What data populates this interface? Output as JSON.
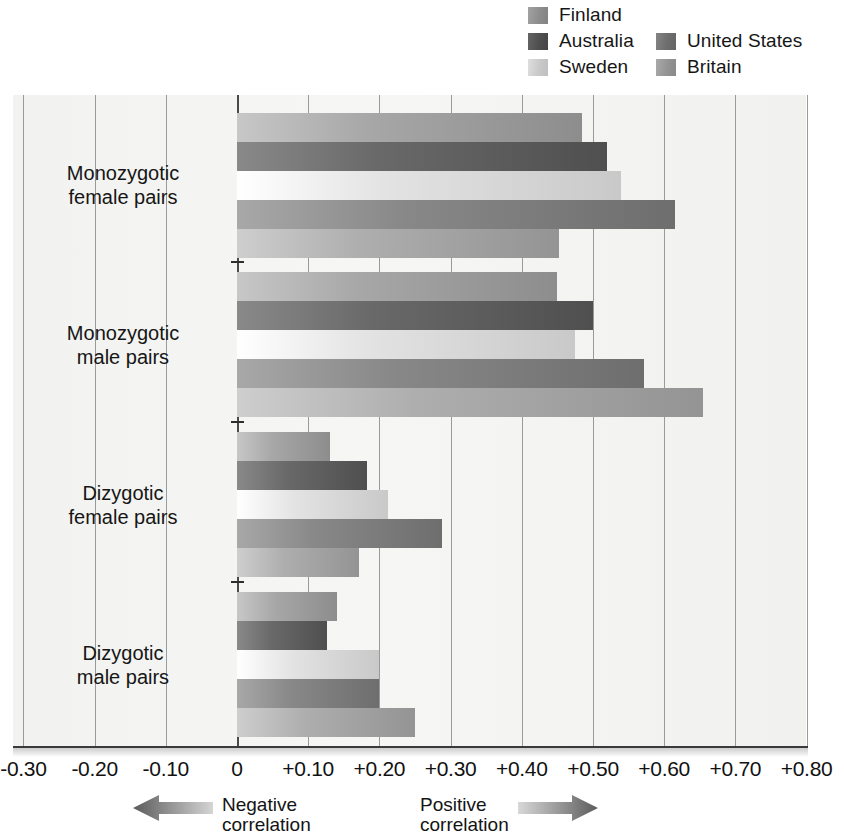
{
  "chart_data": {
    "type": "bar",
    "orientation": "horizontal",
    "title": "",
    "xlabel": "",
    "ylabel": "",
    "xlim": [
      -0.3,
      0.8
    ],
    "grid": true,
    "legend_position": "top-right",
    "xticks": [
      "-0.30",
      "-0.20",
      "-0.10",
      "0",
      "+0.10",
      "+0.20",
      "+0.30",
      "+0.40",
      "+0.50",
      "+0.60",
      "+0.70",
      "+0.80"
    ],
    "xtick_values": [
      -0.3,
      -0.2,
      -0.1,
      0,
      0.1,
      0.2,
      0.3,
      0.4,
      0.5,
      0.6,
      0.7,
      0.8
    ],
    "categories": [
      "Monozygotic female pairs",
      "Monozygotic male pairs",
      "Dizygotic female pairs",
      "Dizygotic male pairs"
    ],
    "category_lines": [
      [
        "Monozygotic",
        "female pairs"
      ],
      [
        "Monozygotic",
        "male pairs"
      ],
      [
        "Dizygotic",
        "female pairs"
      ],
      [
        "Dizygotic",
        "male pairs"
      ]
    ],
    "series": [
      {
        "name": "Finland",
        "color": "#8d8d8d",
        "values": [
          0.485,
          0.45,
          0.13,
          0.14
        ]
      },
      {
        "name": "Australia",
        "color": "#4f4f4f",
        "values": [
          0.52,
          0.5,
          0.183,
          0.126
        ]
      },
      {
        "name": "Sweden",
        "color": "#c9c9c9",
        "values": [
          0.54,
          0.475,
          0.212,
          0.2
        ]
      },
      {
        "name": "United States",
        "color": "#6e6e6e",
        "values": [
          0.615,
          0.572,
          0.288,
          0.2
        ]
      },
      {
        "name": "Britain",
        "color": "#949494",
        "values": [
          0.452,
          0.655,
          0.172,
          0.25
        ]
      }
    ]
  },
  "legend": {
    "column_one": [
      "Finland",
      "Australia",
      "Sweden"
    ],
    "column_two": [
      "United States",
      "Britain"
    ]
  },
  "footer": {
    "negative_line1": "Negative",
    "negative_line2": "correlation",
    "positive_line1": "Positive",
    "positive_line2": "correlation"
  }
}
